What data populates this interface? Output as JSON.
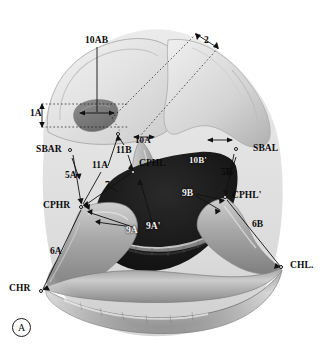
{
  "figure": {
    "id_label": "A",
    "caption_text": "",
    "background_color": "#ffffff",
    "ink_color": "#0b0b0b",
    "white_ink_color": "#f2f2f2"
  },
  "landmarks": [
    {
      "name": "sbar",
      "label": "SBAR",
      "text_x": 36,
      "text_y": 147,
      "marker_x": 70,
      "marker_y": 150,
      "color": "dark"
    },
    {
      "name": "sbal",
      "label": "SBAL",
      "text_x": 253,
      "text_y": 146,
      "marker_x": 236,
      "marker_y": 149,
      "color": "dark"
    },
    {
      "name": "cphr",
      "label": "CPHR",
      "text_x": 43,
      "text_y": 203,
      "marker_x": 81,
      "marker_y": 207,
      "color": "dark"
    },
    {
      "name": "cphl",
      "label": "CPHL",
      "text_x": 139,
      "text_y": 161,
      "marker_x": 133,
      "marker_y": 172,
      "color": "dark"
    },
    {
      "name": "cphl-prime",
      "label": "CPHL'",
      "text_x": 232,
      "text_y": 193,
      "marker_x": 225,
      "marker_y": 197,
      "color": "dark"
    },
    {
      "name": "chr",
      "label": "CHR",
      "text_x": 9,
      "text_y": 286,
      "marker_x": 41,
      "marker_y": 291,
      "color": "dark"
    },
    {
      "name": "chl",
      "label": "CHL.",
      "text_x": 290,
      "text_y": 263,
      "marker_x": 281,
      "marker_y": 267,
      "color": "dark"
    }
  ],
  "measures": [
    {
      "name": "10ab",
      "label": "10AB",
      "text_x": 85,
      "text_y": 38,
      "color": "dark"
    },
    {
      "name": "1a",
      "label": "1A",
      "text_x": 31,
      "text_y": 110,
      "color": "dark"
    },
    {
      "name": "2",
      "label": "2",
      "text_x": 203,
      "text_y": 38,
      "color": "dark"
    },
    {
      "name": "5a",
      "label": "5A",
      "text_x": 66,
      "text_y": 173,
      "color": "dark"
    },
    {
      "name": "5b",
      "label": "5B",
      "text_x": 222,
      "text_y": 170,
      "color": "dark"
    },
    {
      "name": "11a",
      "label": "11A",
      "text_x": 93,
      "text_y": 163,
      "color": "dark"
    },
    {
      "name": "11b",
      "label": "11B",
      "text_x": 117,
      "text_y": 148,
      "color": "dark"
    },
    {
      "name": "10a-prime",
      "label": "10A'",
      "text_x": 136,
      "text_y": 138,
      "color": "dark"
    },
    {
      "name": "10b-prime",
      "label": "10B'",
      "text_x": 189,
      "text_y": 158,
      "color": "white"
    },
    {
      "name": "7",
      "label": "7",
      "text_x": 106,
      "text_y": 183,
      "color": "dark"
    },
    {
      "name": "9a",
      "label": "9A",
      "text_x": 127,
      "text_y": 228,
      "color": "white"
    },
    {
      "name": "9a-prime",
      "label": "9A'",
      "text_x": 146,
      "text_y": 224,
      "color": "white"
    },
    {
      "name": "9b",
      "label": "9B",
      "text_x": 182,
      "text_y": 191,
      "color": "white"
    },
    {
      "name": "6a",
      "label": "6A",
      "text_x": 50,
      "text_y": 249,
      "color": "dark"
    },
    {
      "name": "6b",
      "label": "6B",
      "text_x": 252,
      "text_y": 222,
      "color": "dark"
    }
  ]
}
